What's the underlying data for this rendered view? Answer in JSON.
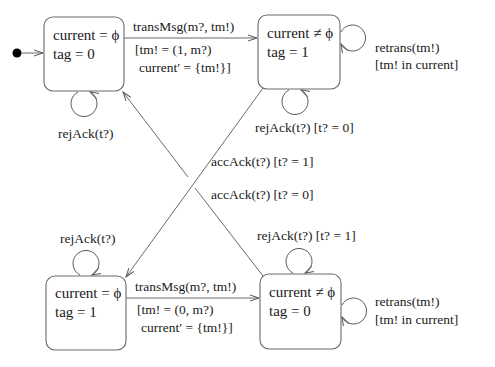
{
  "diagram": {
    "type": "state-machine",
    "initial_state": "s1",
    "states": [
      {
        "id": "s1",
        "line1": "current = ϕ",
        "line2": "tag = 0"
      },
      {
        "id": "s2",
        "line1": "current ≠ ϕ",
        "line2": "tag = 1"
      },
      {
        "id": "s3",
        "line1": "current = ϕ",
        "line2": "tag = 1"
      },
      {
        "id": "s4",
        "line1": "current ≠ ϕ",
        "line2": "tag = 0"
      }
    ],
    "transitions": {
      "s1_to_s2": {
        "event": "transMsg(m?, tm!)",
        "guard1": "[tm! = (1, m?)",
        "guard2": "current′ = {tm!}]"
      },
      "s3_to_s4": {
        "event": "transMsg(m?, tm!)",
        "guard1": "[tm! = (0, m?)",
        "guard2": "current′ = {tm!}]"
      },
      "s2_to_s3": {
        "label": "accAck(t?) [t? = 1]"
      },
      "s4_to_s1": {
        "label": "accAck(t?) [t? = 0]"
      },
      "s1_self": {
        "label": "rejAck(t?)"
      },
      "s2_self_rej": {
        "label": "rejAck(t?) [t? = 0]"
      },
      "s2_self_retrans": {
        "line1": "retrans(tm!)",
        "line2": "[tm!  in  current]"
      },
      "s3_self": {
        "label": "rejAck(t?)"
      },
      "s4_self_rej": {
        "label": "rejAck(t?) [t? = 1]"
      },
      "s4_self_retrans": {
        "line1": "retrans(tm!)",
        "line2": "[tm!  in  current]"
      }
    },
    "colors": {
      "line": "#6a6a6a",
      "text": "#1a1a1a",
      "initial_dot": "#000000"
    }
  }
}
